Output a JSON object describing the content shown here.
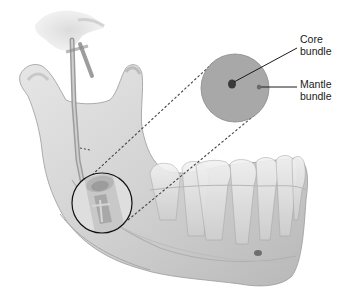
{
  "diagram": {
    "labels": {
      "core": [
        "Core",
        "bundle"
      ],
      "mantle": [
        "Mantle",
        "bundle"
      ]
    },
    "colors": {
      "bone": "#d6d6d6",
      "bone_shadow": "#a9a9a9",
      "bone_outline": "#9a9a9a",
      "inset_circle": "#a8a8a8",
      "inset_outline": "#8c8c8c",
      "core_dot": "#3a3a3a",
      "mantle_dot": "#6a6a6a",
      "leader_line": "#1a1a1a",
      "dash_line": "#444444",
      "magnifier_ring": "#111111",
      "text": "#1a1a1a"
    }
  }
}
